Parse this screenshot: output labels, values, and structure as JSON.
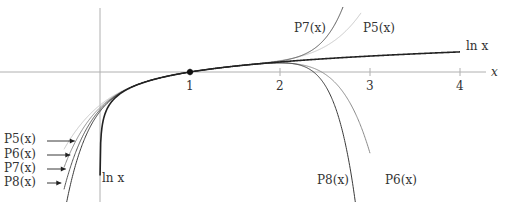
{
  "figure": {
    "axis_x_label": "x",
    "x_ticks": [
      "1",
      "2",
      "3",
      "4"
    ],
    "center_point": {
      "x": 1,
      "y": 0
    },
    "curve_labels": {
      "ln_right": "ln x",
      "ln_bottom": "ln x",
      "p7_top": "P7(x)",
      "p5_top": "P5(x)",
      "p8_bottom": "P8(x)",
      "p6_bottom": "P6(x)",
      "left_p5": "P5(x)",
      "left_p6": "P6(x)",
      "left_p7": "P7(x)",
      "left_p8": "P8(x)"
    },
    "colors": {
      "axis": "#b0b0b0",
      "ln": "#222222",
      "p5": "#c8c8c8",
      "p6": "#8a8a8a",
      "p7": "#555555",
      "p8": "#3a3a3a",
      "text": "#333333"
    },
    "curves": [
      {
        "name": "ln x",
        "degree": 0
      },
      {
        "name": "P5(x)",
        "degree": 5
      },
      {
        "name": "P6(x)",
        "degree": 6
      },
      {
        "name": "P7(x)",
        "degree": 7
      },
      {
        "name": "P8(x)",
        "degree": 8
      }
    ]
  }
}
